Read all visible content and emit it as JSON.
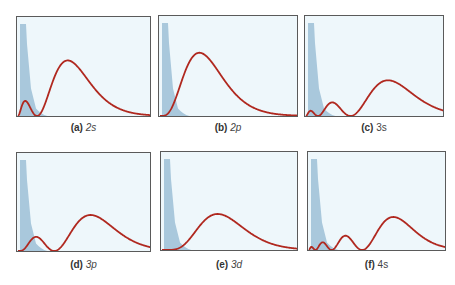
{
  "colors": {
    "plot_bg": "#eef7fb",
    "core_fill": "#a9c8dc",
    "curve": "#b0281f",
    "frame": "#5a5a5a"
  },
  "chart_data": {
    "type": "line",
    "xlabel": "",
    "ylabel": "",
    "grid": false,
    "legend": null,
    "panels": [
      {
        "id": "a",
        "tag": "(a)",
        "orbital": "2s",
        "n": 2,
        "l": 0,
        "nodes": 1,
        "peaks": 2
      },
      {
        "id": "b",
        "tag": "(b)",
        "orbital": "2p",
        "n": 2,
        "l": 1,
        "nodes": 0,
        "peaks": 1
      },
      {
        "id": "c",
        "tag": "(c)",
        "orbital": "3s",
        "n": 3,
        "l": 0,
        "nodes": 2,
        "peaks": 3
      },
      {
        "id": "d",
        "tag": "(d)",
        "orbital": "3p",
        "n": 3,
        "l": 1,
        "nodes": 1,
        "peaks": 2
      },
      {
        "id": "e",
        "tag": "(e)",
        "orbital": "3d",
        "n": 3,
        "l": 2,
        "nodes": 0,
        "peaks": 1
      },
      {
        "id": "f",
        "tag": "(f)",
        "orbital": "4s",
        "n": 4,
        "l": 0,
        "nodes": 3,
        "peaks": 4
      }
    ]
  },
  "panels": [
    {
      "tag": "(a) ",
      "orbital": "2s",
      "italic": true
    },
    {
      "tag": "(b) ",
      "orbital": "2p",
      "italic": true
    },
    {
      "tag": "(c) ",
      "orbital": "3s",
      "italic": false
    },
    {
      "tag": "(d) ",
      "orbital": "3p",
      "italic": true
    },
    {
      "tag": "(e) ",
      "orbital": "3d",
      "italic": true
    },
    {
      "tag": "(f) ",
      "orbital": "4s",
      "italic": false
    }
  ]
}
